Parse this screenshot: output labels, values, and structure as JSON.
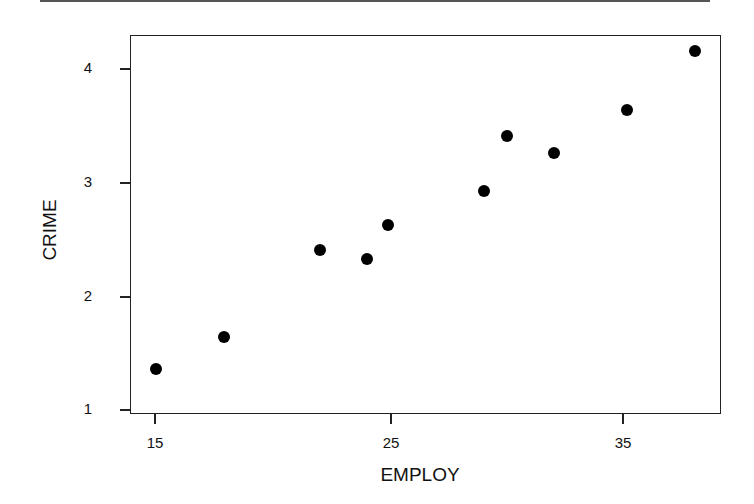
{
  "chart_data": {
    "type": "scatter",
    "title": "",
    "xlabel": "EMPLOY",
    "ylabel": "CRIME",
    "xlim": [
      14,
      42
    ],
    "ylim": [
      0.95,
      4.3
    ],
    "xticks": [
      15,
      25,
      35
    ],
    "yticks": [
      1,
      2,
      3,
      4
    ],
    "grid": false,
    "legend": null,
    "series": [
      {
        "name": "CRIME vs EMPLOY",
        "marker": "filled-circle",
        "color": "#000000",
        "points": [
          {
            "x": 15.1,
            "y": 1.35
          },
          {
            "x": 18.0,
            "y": 1.63
          },
          {
            "x": 22.1,
            "y": 2.4
          },
          {
            "x": 24.1,
            "y": 2.32
          },
          {
            "x": 25.0,
            "y": 2.62
          },
          {
            "x": 29.1,
            "y": 2.92
          },
          {
            "x": 30.1,
            "y": 3.4
          },
          {
            "x": 32.1,
            "y": 3.25
          },
          {
            "x": 35.2,
            "y": 3.63
          },
          {
            "x": 38.1,
            "y": 4.15
          }
        ]
      }
    ]
  },
  "labels": {
    "xlabel": "EMPLOY",
    "ylabel": "CRIME",
    "xticks": [
      "15",
      "25",
      "35"
    ],
    "yticks": [
      "4",
      "3",
      "2",
      "1"
    ]
  }
}
